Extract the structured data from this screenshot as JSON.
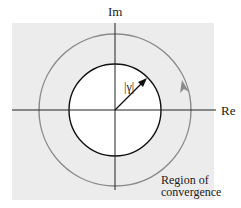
{
  "figure": {
    "type": "z-plane region of convergence diagram",
    "axes": {
      "horizontal_label": "Re",
      "vertical_label": "Im"
    },
    "inner_circle": {
      "label": "|γ|",
      "description": "circle of radius |γ| centered at origin (excluded from region)"
    },
    "outer_circle": {
      "description": "counterclockwise contour in region of convergence",
      "direction": "counterclockwise"
    },
    "region_label_line1": "Region of",
    "region_label_line2": "convergence",
    "colors": {
      "region_fill": "#ececec",
      "inner_fill": "#ffffff",
      "axis_stroke": "#222222",
      "inner_circle_stroke": "#111111",
      "contour_stroke": "#8a8a8a"
    }
  }
}
